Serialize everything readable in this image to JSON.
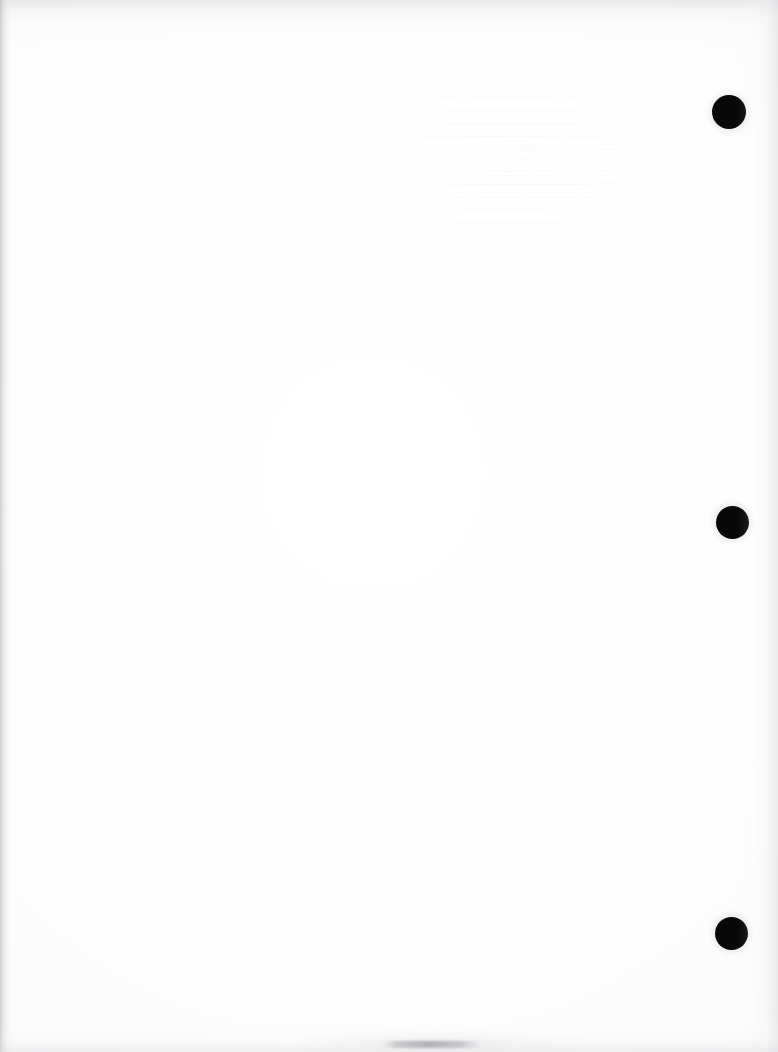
{
  "page": {
    "kind": "scanned-blank-page",
    "width": 778,
    "height": 1052,
    "background_color": "#ffffff",
    "paper_tone_color": "#fdfdfd"
  },
  "marks": {
    "ink_color": "#080808",
    "dots": [
      {
        "name": "registration-dot-top",
        "cx": 729,
        "cy": 112,
        "diameter": 34,
        "label": "1"
      },
      {
        "name": "registration-dot-middle",
        "cx": 732,
        "cy": 522,
        "diameter": 33,
        "label": "2"
      },
      {
        "name": "registration-dot-bottom",
        "cx": 731,
        "cy": 933,
        "diameter": 33,
        "label": "3"
      }
    ]
  },
  "artifacts": {
    "edge_shadow_color": "#a8a8ac",
    "left_edge": {
      "name": "left-edge-shadow",
      "width": 14
    },
    "top_edge": {
      "name": "top-edge-shadow",
      "height": 46
    },
    "right_edge": {
      "name": "right-edge-shadow",
      "width": 40
    },
    "bottom_edge": {
      "name": "bottom-edge-shadow",
      "height": 34
    },
    "bleed_through": {
      "name": "bleed-through-ghosting",
      "region": "upper-middle",
      "x": 330,
      "y": 50,
      "width": 360,
      "height": 215,
      "legible": false
    },
    "smudge": {
      "name": "bottom-center-smudge",
      "color": "#969699",
      "x": 383,
      "y": 1041,
      "width": 98,
      "height": 7
    }
  },
  "text": {
    "visible_text": "",
    "note": "No legible text is present anywhere on the page"
  }
}
